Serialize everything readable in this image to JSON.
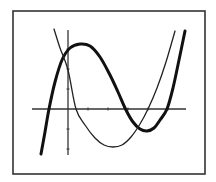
{
  "chart_data": {
    "type": "line",
    "title": "",
    "xlabel": "",
    "ylabel": "",
    "grid": false,
    "legend": null,
    "frame": {
      "x": 13,
      "y": 11,
      "width": 192,
      "height": 163,
      "color": "#333333"
    },
    "axes": {
      "x_axis": {
        "y": 109,
        "x_start": 32,
        "x_end": 186,
        "ticks_px": [
          88,
          108,
          128,
          148,
          168
        ]
      },
      "y_axis": {
        "x": 68,
        "y_start": 30,
        "y_end": 155,
        "ticks_px": [
          49,
          69,
          89,
          129,
          149
        ]
      },
      "color": "#333333"
    },
    "unit_px": 20,
    "series": [
      {
        "name": "thick-cubic",
        "description": "thick cubic curve with a local maximum left and a local minimum right",
        "stroke_width": 3,
        "color": "#111111",
        "points_px": [
          [
            41,
            154
          ],
          [
            45,
            132
          ],
          [
            49,
            109
          ],
          [
            55,
            82
          ],
          [
            62,
            60
          ],
          [
            70,
            48
          ],
          [
            80,
            44
          ],
          [
            90,
            46
          ],
          [
            100,
            57
          ],
          [
            110,
            75
          ],
          [
            118,
            92
          ],
          [
            126,
            110
          ],
          [
            133,
            122
          ],
          [
            140,
            129
          ],
          [
            147,
            131
          ],
          [
            154,
            128
          ],
          [
            160,
            120
          ],
          [
            167,
            109
          ],
          [
            173,
            88
          ],
          [
            179,
            60
          ],
          [
            185,
            31
          ]
        ],
        "approx_values": [
          {
            "x": -1.35,
            "y": -2.25
          },
          {
            "x": -0.95,
            "y": 0
          },
          {
            "x": 0.6,
            "y": 3.25
          },
          {
            "x": 2.9,
            "y": 0
          },
          {
            "x": 3.95,
            "y": -1.1
          },
          {
            "x": 4.95,
            "y": 0
          },
          {
            "x": 5.85,
            "y": 3.9
          }
        ]
      },
      {
        "name": "thin-parabola",
        "description": "thin upward parabola",
        "stroke_width": 1.3,
        "color": "#222222",
        "points_px": [
          [
            54,
            29
          ],
          [
            60,
            48
          ],
          [
            68,
            70
          ],
          [
            76,
            109
          ],
          [
            85,
            125
          ],
          [
            95,
            138
          ],
          [
            104,
            145
          ],
          [
            113,
            147
          ],
          [
            122,
            145
          ],
          [
            131,
            137
          ],
          [
            140,
            124
          ],
          [
            148,
            109
          ],
          [
            157,
            88
          ],
          [
            166,
            62
          ],
          [
            175,
            31
          ]
        ],
        "approx_values": [
          {
            "x": -0.7,
            "y": 4
          },
          {
            "x": 0,
            "y": 1.95
          },
          {
            "x": 0.4,
            "y": 0
          },
          {
            "x": 2.25,
            "y": -1.9
          },
          {
            "x": 4,
            "y": 0
          },
          {
            "x": 5.35,
            "y": 3.9
          }
        ]
      }
    ]
  }
}
